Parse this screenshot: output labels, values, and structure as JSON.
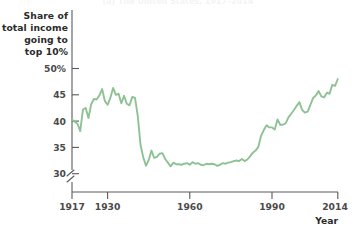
{
  "figure": {
    "title_partial": "(a) The United States, 1917–2014",
    "title_visible": false
  },
  "chart_data": {
    "type": "line",
    "title": "",
    "xlabel": "Year",
    "ylabel": "Share of total income going to top 10%",
    "ylabel_lines": [
      "Share of",
      "total income",
      "going to",
      "top 10%"
    ],
    "series_color": "#8ec295",
    "grid": false,
    "legend": "none",
    "xlim": [
      1917,
      2014
    ],
    "ylim": [
      28.5,
      51
    ],
    "y_axis_break": true,
    "y_axis_break_below": 30,
    "xticks": [
      1917,
      1930,
      1960,
      1990,
      2014
    ],
    "xticklabels": [
      "1917",
      "1930",
      "1960",
      "1990",
      "2014"
    ],
    "yticks": [
      30,
      35,
      40,
      45,
      50
    ],
    "yticklabels": [
      "30",
      "35",
      "40",
      "45",
      "50%"
    ],
    "series": [
      {
        "name": "Share of total income going to top 10%",
        "x": [
          1917,
          1918,
          1919,
          1920,
          1921,
          1922,
          1923,
          1924,
          1925,
          1926,
          1927,
          1928,
          1929,
          1930,
          1931,
          1932,
          1933,
          1934,
          1935,
          1936,
          1937,
          1938,
          1939,
          1940,
          1941,
          1942,
          1943,
          1944,
          1945,
          1946,
          1947,
          1948,
          1949,
          1950,
          1951,
          1952,
          1953,
          1954,
          1955,
          1956,
          1957,
          1958,
          1959,
          1960,
          1961,
          1962,
          1963,
          1964,
          1965,
          1966,
          1967,
          1968,
          1969,
          1970,
          1971,
          1972,
          1973,
          1974,
          1975,
          1976,
          1977,
          1978,
          1979,
          1980,
          1981,
          1982,
          1983,
          1984,
          1985,
          1986,
          1987,
          1988,
          1989,
          1990,
          1991,
          1992,
          1993,
          1994,
          1995,
          1996,
          1997,
          1998,
          1999,
          2000,
          2001,
          2002,
          2003,
          2004,
          2005,
          2006,
          2007,
          2008,
          2009,
          2010,
          2011,
          2012,
          2013,
          2014
        ],
        "y": [
          40.3,
          39.9,
          39.5,
          38.1,
          42.2,
          42.5,
          40.6,
          43.2,
          44.2,
          44.1,
          44.9,
          46.1,
          43.8,
          43.1,
          44.4,
          46.3,
          45.0,
          45.2,
          43.4,
          44.8,
          43.3,
          43.0,
          44.6,
          44.4,
          41.0,
          35.5,
          33.1,
          31.5,
          32.6,
          34.4,
          33.0,
          33.2,
          33.8,
          33.9,
          32.8,
          32.1,
          31.4,
          32.1,
          31.8,
          31.8,
          31.7,
          31.9,
          32.0,
          31.7,
          32.2,
          31.9,
          32.0,
          31.7,
          31.6,
          31.9,
          31.8,
          31.9,
          31.8,
          31.5,
          31.7,
          32.0,
          31.9,
          32.1,
          32.2,
          32.4,
          32.5,
          32.4,
          32.8,
          32.4,
          32.7,
          33.3,
          34.0,
          34.4,
          35.1,
          37.2,
          38.3,
          39.2,
          38.8,
          38.8,
          38.4,
          40.3,
          39.3,
          39.3,
          39.6,
          40.7,
          41.4,
          42.1,
          42.9,
          43.6,
          42.1,
          41.6,
          41.8,
          43.1,
          44.4,
          44.9,
          45.7,
          44.7,
          44.5,
          45.4,
          45.2,
          46.9,
          46.7,
          48.0
        ]
      }
    ]
  },
  "axes": {
    "year_label": "Year"
  }
}
